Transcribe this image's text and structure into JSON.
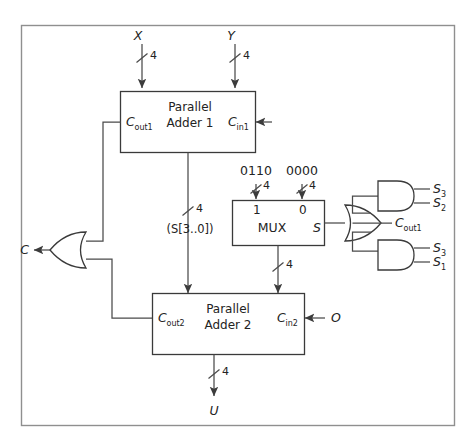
{
  "figure": {
    "type": "logic-circuit-diagram",
    "border_color": "#8a8a8a",
    "wire_color": "#4a4a4a",
    "text_color": "#232323",
    "background": "#ffffff"
  },
  "blocks": {
    "adder1": {
      "line1": "Parallel",
      "line2": "Adder 1",
      "port_left": "C",
      "port_left_sub": "out1",
      "port_right": "C",
      "port_right_sub": "in1"
    },
    "adder2": {
      "line1": "Parallel",
      "line2": "Adder 2",
      "port_left": "C",
      "port_left_sub": "out2",
      "port_right": "C",
      "port_right_sub": "in2"
    },
    "mux": {
      "label": "MUX",
      "input_sel_1": "1",
      "input_sel_0": "0",
      "output": "S"
    }
  },
  "signals": {
    "input_x": "X",
    "input_y": "Y",
    "output_c": "C",
    "output_u": "U",
    "cin2_source": "O",
    "bus_label": "(S[3..0])",
    "mux_const_1": "0110",
    "mux_const_0": "0000",
    "or_input_mid": "C",
    "or_input_mid_sub": "out1"
  },
  "bus_widths": {
    "x": "4",
    "y": "4",
    "sum1": "4",
    "mux_const_1": "4",
    "mux_const_0": "4",
    "mux_out": "4",
    "u": "4"
  },
  "gates": {
    "and_top": {
      "name": "and-gate-top",
      "inputs": [
        {
          "base": "S",
          "sub": "3"
        },
        {
          "base": "S",
          "sub": "2"
        }
      ]
    },
    "and_bottom": {
      "name": "and-gate-bottom",
      "inputs": [
        {
          "base": "S",
          "sub": "3"
        },
        {
          "base": "S",
          "sub": "1"
        }
      ]
    },
    "or_right": {
      "name": "or-gate-correction",
      "inputs": 3
    },
    "or_left": {
      "name": "or-gate-carry-out",
      "inputs": 2
    }
  }
}
